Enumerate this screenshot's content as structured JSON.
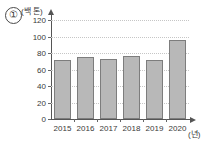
{
  "marker": {
    "label": "①"
  },
  "chart_data": {
    "type": "bar",
    "title": "",
    "xlabel": "(년)",
    "ylabel": "(백 톤)",
    "categories": [
      "2015",
      "2016",
      "2017",
      "2018",
      "2019",
      "2020"
    ],
    "values": [
      71,
      75,
      73,
      76,
      71,
      96
    ],
    "ylim": [
      0,
      120
    ],
    "ytick_step": 20,
    "yticks": [
      "0",
      "20",
      "40",
      "60",
      "80",
      "100",
      "120"
    ],
    "grid": true,
    "legend": "none",
    "bar_color": "#b8b8b8",
    "bar_border_color": "#7d7d7d",
    "axis_color": "#555555",
    "grid_color": "#c6c6c6"
  }
}
